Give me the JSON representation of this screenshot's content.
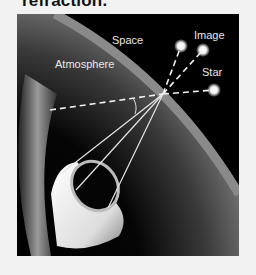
{
  "caption": "refraction.",
  "diagram": {
    "labels": {
      "space": "Space",
      "image": "Image",
      "atmosphere": "Atmosphere",
      "star": "Star"
    },
    "colors": {
      "background": "#000000",
      "atmosphere_band": "#8a8a8a",
      "rays": "#e6e6e6",
      "page": "#f2f2f2"
    }
  }
}
